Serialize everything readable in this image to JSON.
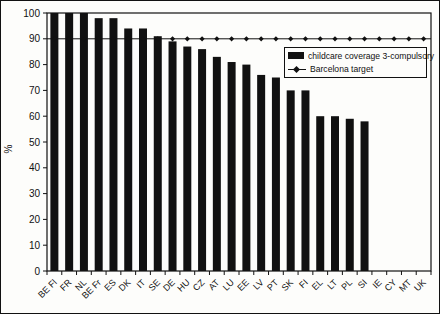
{
  "figure": {
    "background": "#fdfdfb",
    "ink_color": "#111111"
  },
  "chart_data": {
    "type": "bar",
    "title": "",
    "xlabel": "",
    "ylabel": "%",
    "ylim": [
      0,
      100
    ],
    "yticks": [
      0,
      10,
      20,
      30,
      40,
      50,
      60,
      70,
      80,
      90,
      100
    ],
    "grid": "off",
    "legend_position": "upper-right-inside",
    "categories": [
      "BE Fl",
      "FR",
      "NL",
      "BE Fr",
      "ES",
      "DK",
      "IT",
      "SE",
      "DE",
      "HU",
      "CZ",
      "AT",
      "LU",
      "EE",
      "LV",
      "PT",
      "SK",
      "FI",
      "EL",
      "LT",
      "PL",
      "SI",
      "IE",
      "CY",
      "MT",
      "UK"
    ],
    "series": [
      {
        "name": "childcare coverage 3-compulsory",
        "type": "bar",
        "color": "#111111",
        "values": [
          100,
          100,
          100,
          98,
          98,
          94,
          94,
          91,
          89,
          87,
          86,
          83,
          81,
          80,
          76,
          75,
          70,
          70,
          60,
          60,
          59,
          58,
          null,
          null,
          null,
          null
        ]
      },
      {
        "name": "Barcelona target",
        "type": "line",
        "color": "#111111",
        "marker": "diamond",
        "value": 90
      }
    ]
  },
  "legend": {
    "bar_label": "childcare coverage 3-compulsory",
    "line_label": "Barcelona target"
  }
}
